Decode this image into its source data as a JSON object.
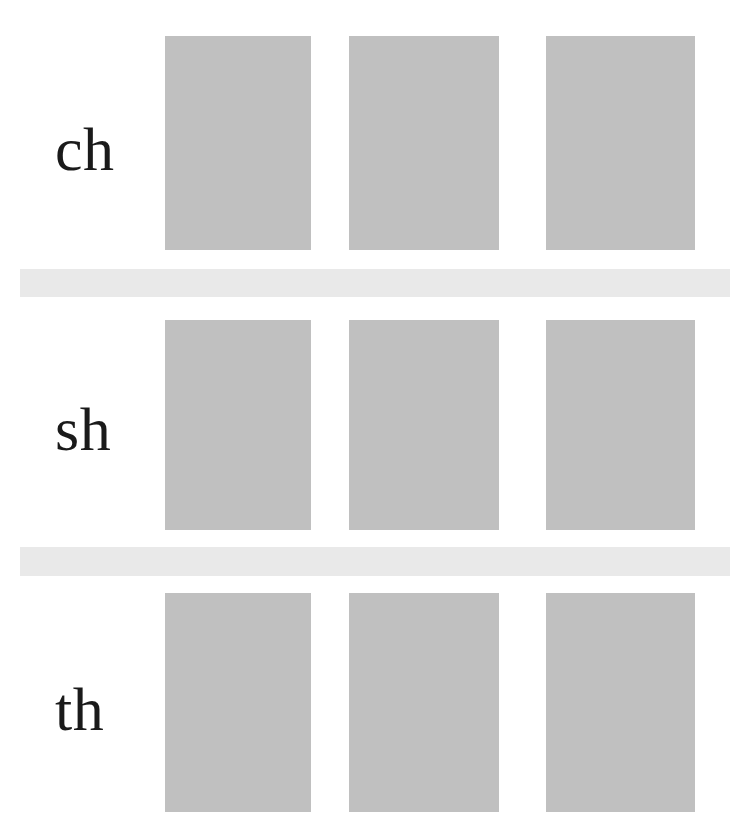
{
  "page": {
    "width": 749,
    "height": 840,
    "background_color": "#ffffff"
  },
  "colors": {
    "placeholder_fill": "#c0c0c0",
    "divider_band": "#e9e9e9",
    "label_text": "#1a1a1a",
    "page_background": "#ffffff"
  },
  "rows": [
    {
      "label": "ch",
      "label_x": 55,
      "label_y": 118,
      "cells": [
        {
          "x": 165,
          "y": 36,
          "width": 146,
          "height": 214
        },
        {
          "x": 349,
          "y": 36,
          "width": 150,
          "height": 214
        },
        {
          "x": 546,
          "y": 36,
          "width": 149,
          "height": 214
        }
      ]
    },
    {
      "label": "sh",
      "label_x": 55,
      "label_y": 398,
      "cells": [
        {
          "x": 165,
          "y": 320,
          "width": 146,
          "height": 210
        },
        {
          "x": 349,
          "y": 320,
          "width": 150,
          "height": 210
        },
        {
          "x": 546,
          "y": 320,
          "width": 149,
          "height": 210
        }
      ]
    },
    {
      "label": "th",
      "label_x": 55,
      "label_y": 678,
      "cells": [
        {
          "x": 165,
          "y": 593,
          "width": 146,
          "height": 219
        },
        {
          "x": 349,
          "y": 593,
          "width": 150,
          "height": 219
        },
        {
          "x": 546,
          "y": 593,
          "width": 149,
          "height": 219
        }
      ]
    }
  ],
  "dividers": [
    {
      "x": 20,
      "y": 269,
      "width": 710,
      "height": 28
    },
    {
      "x": 20,
      "y": 547,
      "width": 710,
      "height": 29
    }
  ]
}
